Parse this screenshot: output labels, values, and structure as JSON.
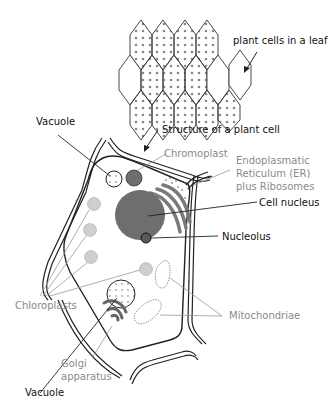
{
  "diagram": {
    "title": "Structure of a plant cell",
    "leaf_caption": "plant cells in a leaf",
    "colors": {
      "outline": "#222222",
      "nucleus": "#6e6e6e",
      "chromoplast": "#6e6e6e",
      "chloroplast": "#cfcfcf",
      "er": "#7a7a7a",
      "label_dark": "#111111",
      "label_grey": "#8a8a8a"
    },
    "labels": {
      "vacuole_top": "Vacuole",
      "chromoplast": "Chromoplast",
      "er_line1": "Endoplasmatic",
      "er_line2": "Reticulum (ER)",
      "er_line3": "plus Ribosomes",
      "cell_nucleus": "Cell nucleus",
      "nucleolus": "Nucleolus",
      "chloroplasts": "Chloroplasts",
      "mitochondriae": "Mitochondriae",
      "golgi_line1": "Golgi",
      "golgi_line2": "apparatus",
      "vacuole_bottom": "Vacuole"
    }
  }
}
